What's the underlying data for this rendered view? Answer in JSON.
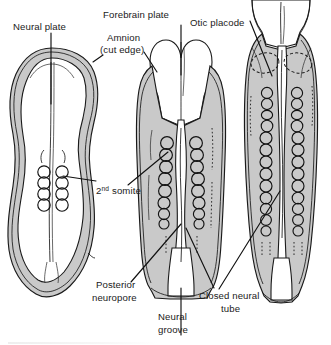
{
  "figure": {
    "background_color": "#ffffff",
    "ectoderm_fill": "#c9c9c9",
    "neural_fill": "#ffffff",
    "ink_color": "#1a1a1a"
  },
  "labels": {
    "neural_plate": "Neural plate",
    "forebrain_plate": "Forebrain plate",
    "amnion_line1": "Amnion",
    "amnion_line2": "(cut edge)",
    "otic_placode": "Otic placode",
    "somite_number": "2",
    "somite_ordinal": "nd",
    "somite_word": "somite",
    "posterior_neuropore_line1": "Posterior",
    "posterior_neuropore_line2": "neuropore",
    "neural_groove_line1": "Neural",
    "neural_groove_line2": "groove",
    "closed_neural_tube_line1": "Closed neural",
    "closed_neural_tube_line2": "tube"
  },
  "embryos": [
    {
      "id": "embryo-left",
      "stage": "presomite / early somite",
      "somite_pairs": 4,
      "features": [
        "neural plate",
        "amnion cut edge",
        "neural groove"
      ]
    },
    {
      "id": "embryo-middle",
      "stage": "7 somite stage",
      "somite_pairs": 8,
      "features": [
        "forebrain plate",
        "neural groove",
        "posterior neuropore",
        "closed neural tube"
      ]
    },
    {
      "id": "embryo-right",
      "stage": "13 somite stage",
      "somite_pairs": 13,
      "features": [
        "otic placode",
        "closed neural tube",
        "posterior neuropore"
      ]
    }
  ]
}
